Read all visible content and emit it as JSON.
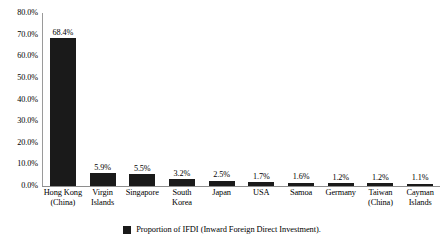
{
  "chart_data": {
    "type": "bar",
    "title": "",
    "subtitle": "",
    "xlabel": "",
    "ylabel": "",
    "ylim": [
      0,
      80
    ],
    "grid": false,
    "legend_position": "bottom",
    "categories": [
      "Hong Kong (China)",
      "Virgin Islands",
      "Singapore",
      "South Korea",
      "Japan",
      "USA",
      "Samoa",
      "Germany",
      "Taiwan (China)",
      "Cayman Islands"
    ],
    "category_lines": [
      [
        "Hong Kong",
        "(China)"
      ],
      [
        "Virgin",
        "Islands"
      ],
      [
        "Singapore"
      ],
      [
        "South",
        "Korea"
      ],
      [
        "Japan"
      ],
      [
        "USA"
      ],
      [
        "Samoa"
      ],
      [
        "Germany"
      ],
      [
        "Taiwan",
        "(China)"
      ],
      [
        "Cayman",
        "Islands"
      ]
    ],
    "values": [
      68.4,
      5.9,
      5.5,
      3.2,
      2.5,
      1.7,
      1.6,
      1.2,
      1.2,
      1.1
    ],
    "value_labels": [
      "68.4%",
      "5.9%",
      "5.5%",
      "3.2%",
      "2.5%",
      "1.7%",
      "1.6%",
      "1.2%",
      "1.2%",
      "1.1%"
    ],
    "ytick_labels": [
      "80.0%",
      "70.0%",
      "60.0%",
      "50.0%",
      "40.0%",
      "30.0%",
      "20.0%",
      "10.0%",
      "0.0%"
    ],
    "ytick_values": [
      80,
      70,
      60,
      50,
      40,
      30,
      20,
      10,
      0
    ],
    "series": [
      {
        "name": "Proportion of IFDI (Inward Foreign Direct Investment).",
        "color": "#1a1a1a",
        "values": [
          68.4,
          5.9,
          5.5,
          3.2,
          2.5,
          1.7,
          1.6,
          1.2,
          1.2,
          1.1
        ]
      }
    ],
    "colors": {
      "bar": "#1a1a1a",
      "axis": "#8e8e8e",
      "text": "#000000",
      "background": "#ffffff"
    }
  },
  "legend": {
    "label": "Proportion of IFDI (Inward Foreign Direct Investment)."
  }
}
